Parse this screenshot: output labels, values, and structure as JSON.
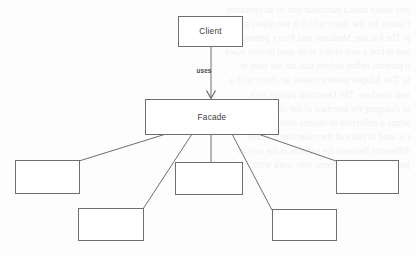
{
  "page": {
    "background_color": "#fdfdfd",
    "stroke_color": "#6e6e6e",
    "text_color": "#3a3a3a",
    "width": 416,
    "height": 256
  },
  "diagram": {
    "kind": "uml-facade-pattern",
    "nodes": [
      {
        "id": "client",
        "label": "Client",
        "x": 178,
        "y": 16,
        "w": 64,
        "h": 30
      },
      {
        "id": "facade",
        "label": "Facade",
        "x": 145,
        "y": 99,
        "w": 133,
        "h": 35
      },
      {
        "id": "subsystem-1",
        "label": "",
        "x": 15,
        "y": 160,
        "w": 64,
        "h": 33
      },
      {
        "id": "subsystem-2",
        "label": "",
        "x": 78,
        "y": 208,
        "w": 65,
        "h": 32
      },
      {
        "id": "subsystem-3",
        "label": "",
        "x": 175,
        "y": 162,
        "w": 67,
        "h": 32
      },
      {
        "id": "subsystem-4",
        "label": "",
        "x": 272,
        "y": 209,
        "w": 64,
        "h": 31
      },
      {
        "id": "subsystem-5",
        "label": "",
        "x": 336,
        "y": 160,
        "w": 62,
        "h": 33
      }
    ],
    "edges": [
      {
        "id": "client-uses-facade",
        "from": "client",
        "to": "facade",
        "label": "uses",
        "arrow": "open-v",
        "style": "solid"
      },
      {
        "id": "facade-to-sub1",
        "from": "facade",
        "to": "subsystem-1",
        "label": "",
        "arrow": "none",
        "style": "solid"
      },
      {
        "id": "facade-to-sub2",
        "from": "facade",
        "to": "subsystem-2",
        "label": "",
        "arrow": "none",
        "style": "solid"
      },
      {
        "id": "facade-to-sub3",
        "from": "facade",
        "to": "subsystem-3",
        "label": "",
        "arrow": "none",
        "style": "solid"
      },
      {
        "id": "facade-to-sub4",
        "from": "facade",
        "to": "subsystem-4",
        "label": "",
        "arrow": "none",
        "style": "solid"
      },
      {
        "id": "facade-to-sub5",
        "from": "facade",
        "to": "subsystem-5",
        "label": "",
        "arrow": "none",
        "style": "solid"
      }
    ],
    "labels": {
      "client": "Client",
      "facade": "Facade",
      "uses": "uses"
    }
  },
  "background_ghost_text": {
    "note": "faint mirrored bleed-through from the reverse side of the scanned page",
    "lines": [
      "ject which does a particular part of an operation",
      "t stands for the object which is the object acted on by",
      "p. The Facade, Mediator, and Proxy patterns",
      "and define a new object to be used in their place.",
      "o patterns define objects that are not used in",
      "ts. The Adapter pattern creates an object with a",
      "rent interface. The Decorator pattern adds",
      "ut changing the interface of the object it",
      "wraps a collection of objects with a single",
      "t is used in place of the collection it wraps.",
      "difference between the patterns is the way in",
      "ject relates to the objects they work with."
    ]
  }
}
